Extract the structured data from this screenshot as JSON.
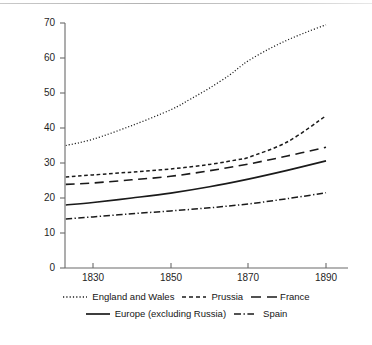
{
  "chart_data": {
    "type": "line",
    "title": "",
    "xlabel": "",
    "ylabel": "Percentage of population defined as 'urban'",
    "xlim": [
      1823,
      1891
    ],
    "ylim": [
      0,
      70
    ],
    "xticks": [
      1830,
      1850,
      1870,
      1890
    ],
    "yticks": [
      0,
      10,
      20,
      30,
      40,
      50,
      60,
      70
    ],
    "grid": false,
    "legend_position": "below",
    "series": [
      {
        "name": "England and Wales",
        "style": "dotted",
        "x": [
          1823,
          1830,
          1840,
          1850,
          1855,
          1860,
          1865,
          1868,
          1870,
          1875,
          1880,
          1885,
          1890
        ],
        "values": [
          35.0,
          36.8,
          40.7,
          45.2,
          48.2,
          51.4,
          55.0,
          57.6,
          59.2,
          62.4,
          65.1,
          67.4,
          69.5
        ]
      },
      {
        "name": "Prussia",
        "style": "dashed",
        "x": [
          1823,
          1830,
          1840,
          1850,
          1860,
          1868,
          1870,
          1880,
          1890
        ],
        "values": [
          26.0,
          26.6,
          27.4,
          28.3,
          29.6,
          31.1,
          31.6,
          36.0,
          43.5
        ]
      },
      {
        "name": "France",
        "style": "long-dashed",
        "x": [
          1823,
          1830,
          1840,
          1850,
          1860,
          1870,
          1880,
          1890
        ],
        "values": [
          23.9,
          24.3,
          25.2,
          26.2,
          27.8,
          29.7,
          32.0,
          34.5
        ]
      },
      {
        "name": "Europe (excluding Russia)",
        "style": "solid",
        "x": [
          1823,
          1830,
          1840,
          1850,
          1860,
          1870,
          1880,
          1890
        ],
        "values": [
          18.0,
          18.7,
          20.0,
          21.4,
          23.2,
          25.4,
          27.9,
          30.6
        ]
      },
      {
        "name": "Spain",
        "style": "dash-dot",
        "x": [
          1823,
          1830,
          1840,
          1850,
          1860,
          1870,
          1880,
          1890
        ],
        "values": [
          14.0,
          14.6,
          15.5,
          16.3,
          17.2,
          18.3,
          19.8,
          21.5
        ]
      }
    ]
  },
  "axes": {
    "y_tick_labels": [
      "70",
      "60",
      "50",
      "40",
      "30",
      "20",
      "10",
      "0"
    ],
    "x_tick_labels": [
      "1830",
      "1850",
      "1870",
      "1890"
    ],
    "y_axis_title": "Percentage of population defined as 'urban'"
  },
  "legend": {
    "row1": [
      {
        "label": "England and Wales",
        "style": "dotted"
      },
      {
        "label": "Prussia",
        "style": "dashed"
      },
      {
        "label": "France",
        "style": "long-dashed"
      }
    ],
    "row2": [
      {
        "label": "Europe (excluding Russia)",
        "style": "solid"
      },
      {
        "label": "Spain",
        "style": "dash-dot"
      }
    ]
  },
  "colors": {
    "line": "#1a1a1a",
    "axis": "#585858",
    "text": "#1a1a1a",
    "background": "#ffffff"
  }
}
